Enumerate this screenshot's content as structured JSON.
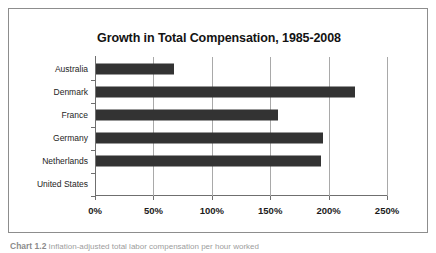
{
  "figure": {
    "caption_number": "Chart 1.2",
    "caption_text": "Inflation-adjusted total labor compensation per hour worked"
  },
  "chart_data": {
    "type": "bar",
    "orientation": "horizontal",
    "title": "Growth in Total Compensation, 1985-2008",
    "xlabel": "",
    "ylabel": "",
    "categories": [
      "Australia",
      "Denmark",
      "France",
      "Germany",
      "Netherlands",
      "United States"
    ],
    "values": [
      67,
      222,
      156,
      194,
      193,
      0
    ],
    "value_unit": "%",
    "xlim": [
      0,
      250
    ],
    "xticks": [
      0,
      50,
      100,
      150,
      200,
      250
    ],
    "xtick_labels": [
      "0%",
      "50%",
      "100%",
      "150%",
      "200%",
      "250%"
    ],
    "grid": true,
    "grid_axis": "x",
    "legend": null,
    "bar_color": "#333333",
    "axis_color": "#6f6f6f",
    "gridline_color": "#a9a9a9"
  }
}
